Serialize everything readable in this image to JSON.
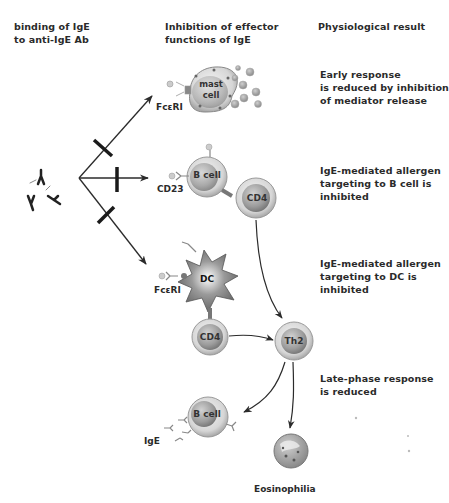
{
  "headers": {
    "col1": "binding of IgE\nto anti-IgE Ab",
    "col2": "Inhibition of effector\nfunctions of IgE",
    "col3": "Physiological result"
  },
  "cells": {
    "mast_cell": "mast\ncell",
    "b_cell_top": "B cell",
    "cd4_top": "CD4",
    "dc": "DC",
    "cd4_bottom": "CD4",
    "th2": "Th2",
    "b_cell_bottom": "B cell"
  },
  "receptors": {
    "fcer1_top": "FcεRI",
    "cd23": "CD23",
    "fcer1_dc": "FcεRI"
  },
  "results": {
    "early": "Early response\nis reduced by inhibition\nof mediator release",
    "b_cell": "IgE-mediated allergen\ntargeting to B cell is\ninhibited",
    "dc": "IgE-mediated allergen\ntargeting to DC is\ninhibited",
    "late": "Late-phase response\nis reduced"
  },
  "bottom": {
    "ige": "IgE",
    "eosinophilia": "Eosinophilia"
  },
  "colors": {
    "arrow": "#2b2b2b",
    "cell_outer": "#d9d9d9",
    "cell_inner": "#9a9a9a",
    "text": "#2a2a2a"
  }
}
